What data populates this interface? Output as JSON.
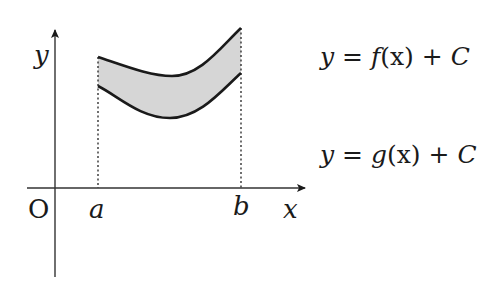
{
  "diagram": {
    "type": "area-between-curves",
    "labels": {
      "origin": "O",
      "y_axis": "y",
      "x_axis": "x",
      "a": "a",
      "b": "b"
    },
    "equations": {
      "upper": {
        "lhs": "y",
        "eq": "=",
        "func": "f",
        "arg": "(x)",
        "plus": "+",
        "const": "C"
      },
      "lower": {
        "lhs": "y",
        "eq": "=",
        "func": "g",
        "arg": "(x)",
        "plus": "+",
        "const": "C"
      }
    },
    "colors": {
      "line": "#1a1a1a",
      "fill": "#d6d6d6",
      "axis": "#333333",
      "background": "#ffffff"
    }
  }
}
